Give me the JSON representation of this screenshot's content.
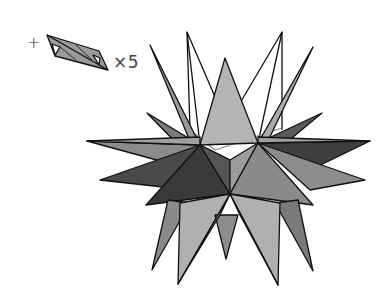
{
  "diagram": {
    "title": "",
    "prefix_symbol": "+",
    "multiplier_label": "×5",
    "unit_piece": "folded-module",
    "figure": "stellated-origami-star",
    "colors": {
      "light": "#b4b4b4",
      "mid": "#8c8c8c",
      "dark": "#4a4a4a",
      "outline": "#111111",
      "background": "#ffffff"
    }
  }
}
